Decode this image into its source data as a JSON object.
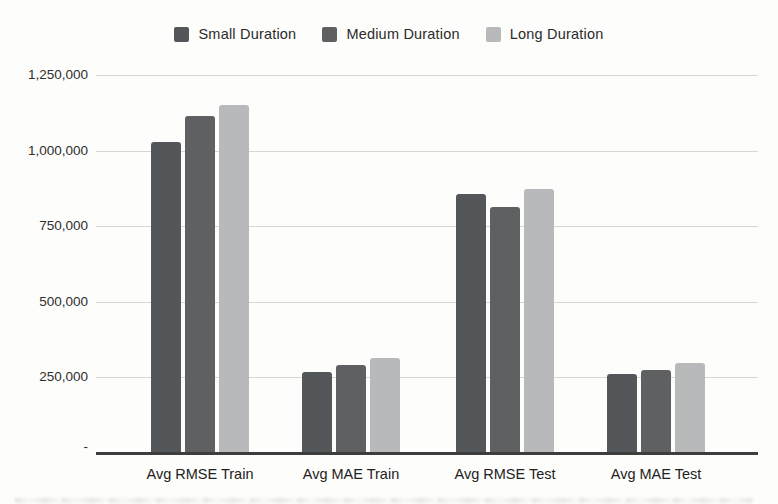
{
  "chart_data": {
    "type": "bar",
    "title": "",
    "categories": [
      "Avg RMSE Train",
      "Avg MAE Train",
      "Avg RMSE Test",
      "Avg MAE Test"
    ],
    "series": [
      {
        "name": "Small Duration",
        "color": "#54575a",
        "values": [
          1030000,
          268000,
          856000,
          261000
        ]
      },
      {
        "name": "Medium Duration",
        "color": "#5e6062",
        "values": [
          1115000,
          291000,
          815000,
          275000
        ]
      },
      {
        "name": "Long Duration",
        "color": "#b7b9bb",
        "values": [
          1150000,
          314000,
          874000,
          297000
        ]
      }
    ],
    "xlabel": "",
    "ylabel": "",
    "ylim": [
      0,
      1250000
    ],
    "ytick_values": [
      0,
      250000,
      500000,
      750000,
      1000000,
      1250000
    ],
    "ytick_labels": [
      "-",
      "250,000",
      "500,000",
      "750,000",
      "1,000,000",
      "1,250,000"
    ],
    "grid": true,
    "legend_position": "top"
  },
  "colors": {
    "gridline": "#d6d6d3",
    "baseline": "#3d3d3d",
    "axis_text": "#2e2e2e",
    "legend_text": "#2b2b2b",
    "background": "#fdfdfc"
  }
}
